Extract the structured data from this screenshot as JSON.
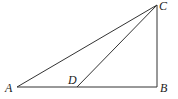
{
  "figure": {
    "type": "geometry-triangle",
    "points": {
      "A": {
        "label": "A",
        "x": 17,
        "y": 87
      },
      "D": {
        "label": "D",
        "x": 77,
        "y": 87
      },
      "B": {
        "label": "B",
        "x": 157,
        "y": 87
      },
      "C": {
        "label": "C",
        "x": 157,
        "y": 5
      }
    },
    "segments": [
      "AB",
      "BC",
      "CA",
      "CD"
    ],
    "line_color": "#333333"
  }
}
